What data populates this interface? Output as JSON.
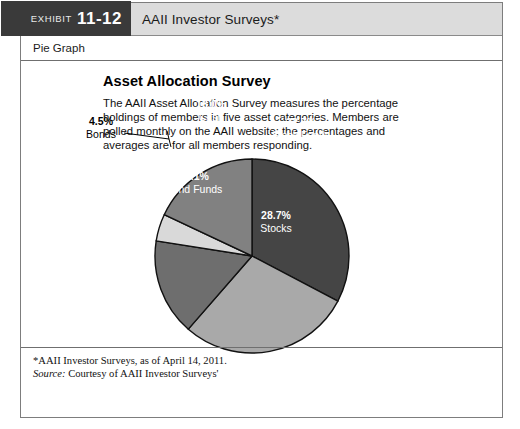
{
  "exhibit": {
    "word": "EXHIBIT",
    "number": "11-12",
    "title": "AAII Investor Surveys*",
    "graph_type": "Pie Graph"
  },
  "content": {
    "title": "Asset Allocation Survey",
    "description": "The AAII Asset Allocation Survey measures the percentage holdings of members in five asset categories. Members are polled monthly on the AAII website; the percentages and averages are for all members responding."
  },
  "footnote": {
    "line1": "*AAII Investor Surveys, as of April 14, 2011.",
    "source_label": "Source:",
    "source_text": " Courtesy of AAII Investor Surveys'"
  },
  "labels": {
    "stock_funds_pct": "32.7%",
    "stock_funds_name": "Stock Funds",
    "stocks_pct": "28.7%",
    "stocks_name": "Stocks",
    "bond_funds_pct": "16.1%",
    "bond_funds_name": "Bond Funds",
    "bonds_pct": "4.5%",
    "bonds_name": "Bonds",
    "cash_pct": "18.0%",
    "cash_name": "Cash"
  },
  "chart_data": {
    "type": "pie",
    "title": "Asset Allocation Survey",
    "categories": [
      "Stock Funds",
      "Stocks",
      "Bond Funds",
      "Bonds",
      "Cash"
    ],
    "values": [
      32.7,
      28.7,
      16.1,
      4.5,
      18.0
    ],
    "value_labels": [
      "32.7%",
      "28.7%",
      "16.1%",
      "4.5%",
      "18.0%"
    ],
    "colors": [
      "#454545",
      "#a9a9a9",
      "#6e6e6e",
      "#d9d9d9",
      "#818181"
    ],
    "label_colors": [
      "#ffffff",
      "#ffffff",
      "#ffffff",
      "#000000",
      "#ffffff"
    ],
    "start_angle_deg": 0,
    "direction": "clockwise",
    "legend": "none",
    "center": [
      251,
      255
    ],
    "radius": 97,
    "total": 100.0
  },
  "theme": {
    "tab_bg": "#3a3a3a",
    "header_bg": "#dcdcdc",
    "border": "#7d7d7d",
    "text": "#111111"
  }
}
